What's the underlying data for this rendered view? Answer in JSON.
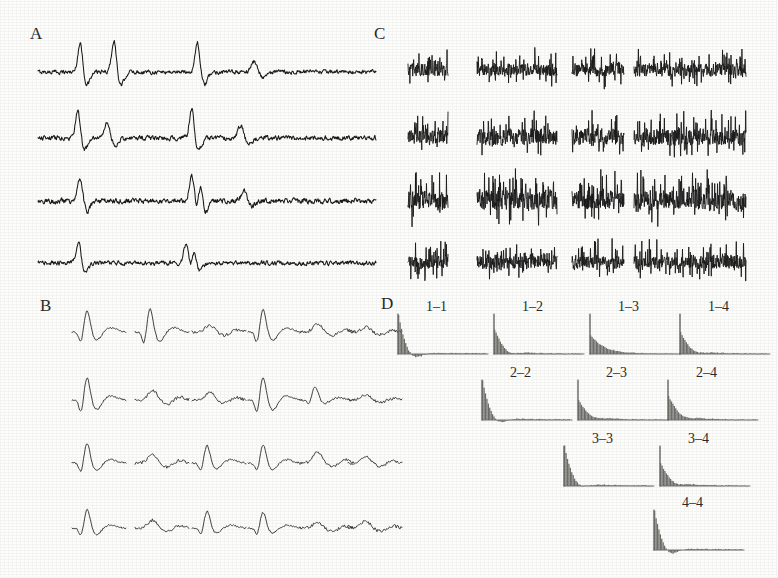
{
  "figure": {
    "background_color": "#fdfdfc",
    "ink_color": "#1a1a1a",
    "panels": [
      {
        "id": "A",
        "label": "A",
        "x": 30,
        "y": 24,
        "description": "extracellular voltage traces with sparse action potentials, 4 channels"
      },
      {
        "id": "B",
        "label": "B",
        "x": 40,
        "y": 296,
        "description": "sorted spike waveform templates, 4 rows by 6 columns"
      },
      {
        "id": "C",
        "label": "C",
        "x": 374,
        "y": 24,
        "description": "high firing rate noisy traces, 4 rows by 4 columns"
      },
      {
        "id": "D",
        "label": "D",
        "x": 381,
        "y": 294,
        "description": "triangular matrix of auto- and cross-correlograms"
      }
    ]
  },
  "chart_data": [
    {
      "type": "line",
      "panel": "A",
      "title": "A",
      "xlabel": "",
      "ylabel": "",
      "grid": false,
      "legend_position": "none",
      "n_rows": 4,
      "trace_x_start": 38,
      "trace_x_end": 376,
      "row_baselines": [
        72,
        138,
        201,
        263
      ],
      "series": [
        {
          "name": "channel 1",
          "baseline": 72,
          "noise_amplitude": 3.2,
          "spikes": [
            {
              "x_frac": 0.125,
              "amplitude": 30,
              "width": 7
            },
            {
              "x_frac": 0.225,
              "amplitude": 33,
              "width": 7
            },
            {
              "x_frac": 0.472,
              "amplitude": 31,
              "width": 7
            },
            {
              "x_frac": 0.64,
              "amplitude": 11,
              "width": 9
            }
          ]
        },
        {
          "name": "channel 2",
          "baseline": 138,
          "noise_amplitude": 3.6,
          "spikes": [
            {
              "x_frac": 0.118,
              "amplitude": 28,
              "width": 7
            },
            {
              "x_frac": 0.205,
              "amplitude": 16,
              "width": 8
            },
            {
              "x_frac": 0.455,
              "amplitude": 30,
              "width": 7
            },
            {
              "x_frac": 0.6,
              "amplitude": 13,
              "width": 8
            }
          ]
        },
        {
          "name": "channel 3",
          "baseline": 201,
          "noise_amplitude": 4.0,
          "spikes": [
            {
              "x_frac": 0.125,
              "amplitude": 25,
              "width": 7
            },
            {
              "x_frac": 0.455,
              "amplitude": 27,
              "width": 7
            },
            {
              "x_frac": 0.48,
              "amplitude": 24,
              "width": 6
            },
            {
              "x_frac": 0.61,
              "amplitude": 12,
              "width": 8
            }
          ]
        },
        {
          "name": "channel 4",
          "baseline": 263,
          "noise_amplitude": 3.4,
          "spikes": [
            {
              "x_frac": 0.12,
              "amplitude": 22,
              "width": 7
            },
            {
              "x_frac": 0.438,
              "amplitude": 20,
              "width": 7
            },
            {
              "x_frac": 0.462,
              "amplitude": 18,
              "width": 6
            }
          ]
        }
      ]
    },
    {
      "type": "line",
      "panel": "B",
      "title": "B",
      "xlabel": "",
      "ylabel": "",
      "grid": false,
      "legend_position": "none",
      "n_rows": 4,
      "n_cols": 6,
      "row_baselines": [
        332,
        400,
        463,
        528
      ],
      "col_x": [
        72,
        135,
        192,
        248,
        300,
        348
      ],
      "cell_width": 54,
      "waveforms": [
        [
          {
            "peak": 22,
            "trough": -12,
            "kind": "large-biphasic"
          },
          {
            "peak": 24,
            "trough": -14,
            "kind": "large-biphasic"
          },
          {
            "peak": 7,
            "trough": -4,
            "kind": "small-multiphasic"
          },
          {
            "peak": 23,
            "trough": -13,
            "kind": "large-biphasic"
          },
          {
            "peak": 8,
            "trough": -4,
            "kind": "small-broad"
          },
          {
            "peak": 5,
            "trough": -3,
            "kind": "noise-like"
          }
        ],
        [
          {
            "peak": 23,
            "trough": -15,
            "kind": "large-biphasic"
          },
          {
            "peak": 10,
            "trough": -5,
            "kind": "medium-broad"
          },
          {
            "peak": 8,
            "trough": -4,
            "kind": "small-broad"
          },
          {
            "peak": 24,
            "trough": -16,
            "kind": "large-biphasic"
          },
          {
            "peak": 14,
            "trough": -5,
            "kind": "medium-peak"
          },
          {
            "peak": 5,
            "trough": -3,
            "kind": "noise-like"
          }
        ],
        [
          {
            "peak": 20,
            "trough": -11,
            "kind": "large-biphasic"
          },
          {
            "peak": 9,
            "trough": -5,
            "kind": "medium-broad"
          },
          {
            "peak": 18,
            "trough": -9,
            "kind": "medium-biphasic"
          },
          {
            "peak": 19,
            "trough": -10,
            "kind": "large-biphasic"
          },
          {
            "peak": 11,
            "trough": -4,
            "kind": "medium-peak"
          },
          {
            "peak": 7,
            "trough": -4,
            "kind": "small-multiphasic"
          }
        ],
        [
          {
            "peak": 19,
            "trough": -10,
            "kind": "large-biphasic"
          },
          {
            "peak": 8,
            "trough": -4,
            "kind": "small-plateau"
          },
          {
            "peak": 17,
            "trough": -8,
            "kind": "medium-biphasic"
          },
          {
            "peak": 16,
            "trough": -8,
            "kind": "medium-biphasic"
          },
          {
            "peak": 6,
            "trough": -4,
            "kind": "noise-like"
          },
          {
            "peak": 7,
            "trough": -4,
            "kind": "noise-like"
          }
        ]
      ]
    },
    {
      "type": "line",
      "panel": "C",
      "title": "C",
      "xlabel": "",
      "ylabel": "",
      "grid": false,
      "legend_position": "none",
      "n_rows": 4,
      "n_cols": 4,
      "row_baselines": [
        70,
        137,
        200,
        262
      ],
      "columns": [
        {
          "x": 408,
          "width": 40
        },
        {
          "x": 477,
          "width": 80
        },
        {
          "x": 572,
          "width": 52
        },
        {
          "x": 634,
          "width": 112
        }
      ],
      "row_amplitudes": [
        12,
        15,
        18,
        13
      ],
      "noise_density": "high",
      "description": "dense multi-unit activity bursts"
    },
    {
      "type": "bar",
      "panel": "D",
      "title": "D",
      "xlabel": "",
      "ylabel": "",
      "grid": false,
      "legend_position": "none",
      "layout": "upper-triangular",
      "cell_width": 96,
      "cell_height": 46,
      "axis_height": 40,
      "cells": [
        {
          "label": "1-1",
          "row": 1,
          "col": 1,
          "x": 396,
          "y": 308,
          "peak": 1.0,
          "decay": 0.085,
          "has_trough": true,
          "trough_depth": 0.22
        },
        {
          "label": "1-2",
          "row": 1,
          "col": 2,
          "x": 492,
          "y": 308,
          "peak": 0.62,
          "decay": 0.12,
          "has_trough": true,
          "trough_depth": 0.12
        },
        {
          "label": "1-3",
          "row": 1,
          "col": 3,
          "x": 588,
          "y": 308,
          "peak": 0.46,
          "decay": 0.15,
          "has_trough": false,
          "trough_depth": 0.05
        },
        {
          "label": "1-4",
          "row": 1,
          "col": 4,
          "x": 678,
          "y": 308,
          "peak": 0.55,
          "decay": 0.13,
          "has_trough": true,
          "trough_depth": 0.1
        },
        {
          "label": "2-2",
          "row": 2,
          "col": 2,
          "x": 480,
          "y": 374,
          "peak": 1.0,
          "decay": 0.09,
          "has_trough": true,
          "trough_depth": 0.2
        },
        {
          "label": "2-3",
          "row": 2,
          "col": 3,
          "x": 576,
          "y": 374,
          "peak": 0.5,
          "decay": 0.14,
          "has_trough": true,
          "trough_depth": 0.08
        },
        {
          "label": "2-4",
          "row": 2,
          "col": 4,
          "x": 666,
          "y": 374,
          "peak": 0.6,
          "decay": 0.135,
          "has_trough": true,
          "trough_depth": 0.09
        },
        {
          "label": "3-3",
          "row": 3,
          "col": 3,
          "x": 562,
          "y": 440,
          "peak": 1.0,
          "decay": 0.095,
          "has_trough": true,
          "trough_depth": 0.16
        },
        {
          "label": "3-4",
          "row": 3,
          "col": 4,
          "x": 658,
          "y": 440,
          "peak": 0.58,
          "decay": 0.13,
          "has_trough": true,
          "trough_depth": 0.1
        },
        {
          "label": "4-4",
          "row": 4,
          "col": 4,
          "x": 652,
          "y": 504,
          "peak": 1.0,
          "decay": 0.09,
          "has_trough": true,
          "trough_depth": 0.24
        }
      ]
    }
  ]
}
